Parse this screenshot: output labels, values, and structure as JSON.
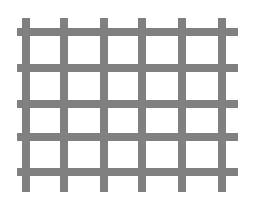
{
  "figure": {
    "width": 254,
    "height": 202,
    "background_color": "#ffffff",
    "bar_color": "#808080",
    "bar_edge_color": "#8d8d8d",
    "bar_thickness": 8,
    "render_style": "scanned-raster",
    "blur_radius": 0.6
  },
  "lattice": {
    "vertical_bar_count": 6,
    "horizontal_bar_count": 5,
    "cell_count_horizontal": 5,
    "cell_count_vertical": 4,
    "vertical_bars": [
      {
        "name": "vertical-bar-1",
        "x": 26,
        "y_start": 18,
        "y_end": 192
      },
      {
        "name": "vertical-bar-2",
        "x": 64,
        "y_start": 18,
        "y_end": 192
      },
      {
        "name": "vertical-bar-3",
        "x": 104,
        "y_start": 18,
        "y_end": 192
      },
      {
        "name": "vertical-bar-4",
        "x": 142,
        "y_start": 18,
        "y_end": 192
      },
      {
        "name": "vertical-bar-5",
        "x": 182,
        "y_start": 18,
        "y_end": 192
      },
      {
        "name": "vertical-bar-6",
        "x": 222,
        "y_start": 18,
        "y_end": 192
      }
    ],
    "horizontal_bars": [
      {
        "name": "horizontal-bar-1",
        "y": 32,
        "x_start": 17,
        "x_end": 238
      },
      {
        "name": "horizontal-bar-2",
        "y": 68,
        "x_start": 17,
        "x_end": 238
      },
      {
        "name": "horizontal-bar-3",
        "y": 104,
        "x_start": 17,
        "x_end": 238
      },
      {
        "name": "horizontal-bar-4",
        "y": 137,
        "x_start": 17,
        "x_end": 238
      },
      {
        "name": "horizontal-bar-5",
        "y": 172,
        "x_start": 17,
        "x_end": 238
      }
    ],
    "vertical_spacing": 39,
    "horizontal_spacing": 35,
    "overhang_top": 14,
    "overhang_bottom": 20,
    "overhang_left": 9,
    "overhang_right": 16
  }
}
